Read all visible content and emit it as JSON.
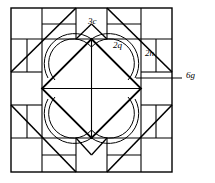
{
  "figure": {
    "stroke_color": "#000000",
    "fill_color": "#ffffff",
    "background": "#ffffff"
  },
  "geometry": {
    "outer_square": {
      "x": 11,
      "y": 8,
      "size": 161
    },
    "inner_square": {
      "x": 42,
      "y": 39,
      "size": 99
    },
    "band_width": 31,
    "center": {
      "x": 91.5,
      "y": 88.5
    },
    "diamond_vertices": [
      {
        "x": 91.5,
        "y": 39
      },
      {
        "x": 141,
        "y": 88.5
      },
      {
        "x": 91.5,
        "y": 138
      },
      {
        "x": 42,
        "y": 88.5
      }
    ]
  },
  "labels": [
    {
      "id": "3c",
      "text": "3c",
      "target": "top-center-band-patch",
      "x": 88,
      "y": 17
    },
    {
      "id": "2q",
      "text": "2q",
      "target": "upper-right-diamond-triangle",
      "x": 113,
      "y": 41
    },
    {
      "id": "2n",
      "text": "2n",
      "target": "right-corner-half-square-triangle",
      "x": 145,
      "y": 49
    },
    {
      "id": "6g",
      "text": "6g",
      "target": "crescent-arc-motif",
      "x": 186,
      "y": 71,
      "leader_line": {
        "x1": 136,
        "y1": 78,
        "x2": 182,
        "y2": 78
      }
    }
  ],
  "motifs": {
    "crescent_count": 4,
    "arcs_per_crescent": 2,
    "description": "Each diamond triangle contains a pair of concentric arcs forming a crescent leaf shape."
  }
}
